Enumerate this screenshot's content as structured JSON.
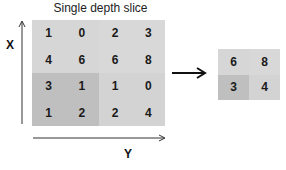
{
  "title": "Single depth slice",
  "axes": {
    "x_label": "X",
    "y_label": "Y"
  },
  "input_grid": {
    "rows": [
      [
        "1",
        "0",
        "2",
        "3"
      ],
      [
        "4",
        "6",
        "6",
        "8"
      ],
      [
        "3",
        "1",
        "1",
        "0"
      ],
      [
        "1",
        "2",
        "2",
        "4"
      ]
    ]
  },
  "output_grid": {
    "rows": [
      [
        "6",
        "8"
      ],
      [
        "3",
        "4"
      ]
    ]
  },
  "colors": {
    "light_cell": "#d3d3d3",
    "light_cell_alt": "#d8d8d8",
    "dark_cell": "#bdbdbd",
    "arrow": "#111111"
  }
}
